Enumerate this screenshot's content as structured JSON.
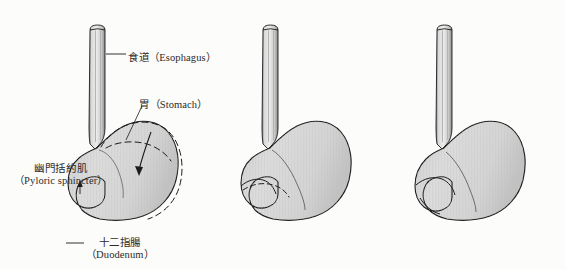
{
  "figure": {
    "panel_count": 3,
    "background_color": "#fcfcfa",
    "organ_fill_color": "#d6d6d6",
    "outline_color": "#1c1c1c",
    "label_text_color": "#2b2b2b"
  },
  "labels": {
    "esophagus": {
      "cjk": "食道",
      "latin": "（Esophagus）"
    },
    "stomach": {
      "cjk": "胃",
      "latin": "（Stomach）"
    },
    "pyloric_sphincter": {
      "cjk": "幽門括約肌",
      "latin": "（Pyloric sphincter）"
    },
    "duodenum": {
      "cjk": "十二指腸",
      "latin": "（Duodenum）"
    }
  },
  "panels": [
    {
      "id": "panel-1",
      "name": "stomach-stage-1",
      "labelled": true,
      "has_dashed_contour": true,
      "has_peristalsis_arrow": true,
      "description": "Relaxed stomach with dashed outline showing distension and arrow indicating wave direction"
    },
    {
      "id": "panel-2",
      "name": "stomach-stage-2",
      "labelled": false,
      "has_dashed_contour": true,
      "has_peristalsis_arrow": false,
      "description": "Peristaltic constriction forming in the antrum near the pylorus"
    },
    {
      "id": "panel-3",
      "name": "stomach-stage-3",
      "labelled": false,
      "has_dashed_contour": false,
      "has_peristalsis_arrow": false,
      "description": "Pyloric sphincter closed, chyme retropulsed back into the stomach body"
    }
  ]
}
